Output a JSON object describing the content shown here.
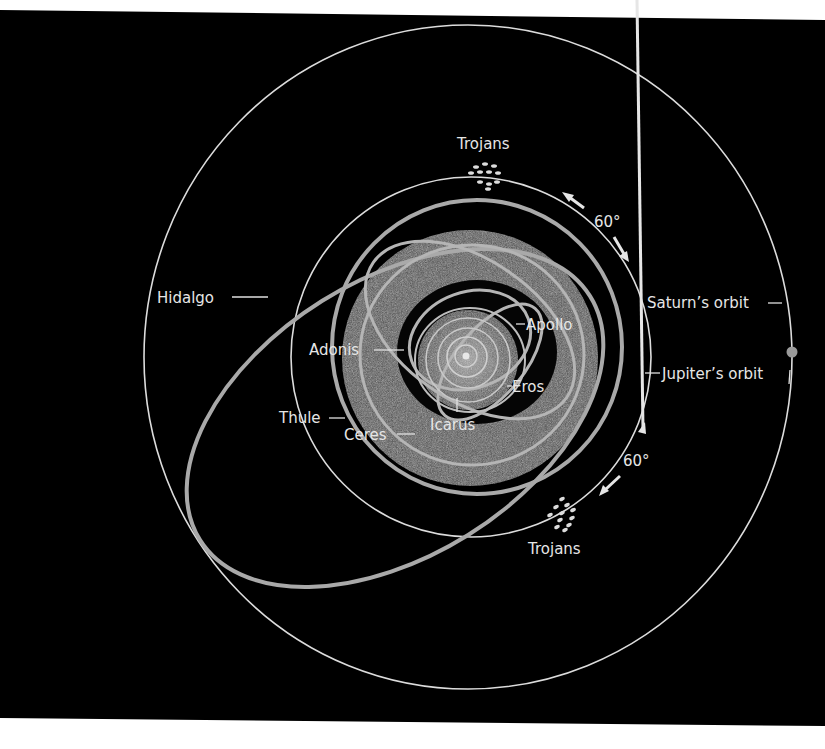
{
  "figure": {
    "colors": {
      "background": "#000000",
      "page": "#ffffff",
      "orbit_line": "#dcdcdc",
      "asteroid_orbit": "#a9a9a9",
      "belt": "#555555",
      "saturn_dot": "#9a9a9a"
    }
  },
  "labels": {
    "trojans_top": "Trojans",
    "trojans_bottom": "Trojans",
    "angle_top": "60°",
    "angle_bottom": "60°",
    "hidalgo": "Hidalgo",
    "saturn_orbit": "Saturn’s orbit",
    "jupiter_orbit": "Jupiter’s orbit",
    "apollo": "Apollo",
    "adonis": "Adonis",
    "eros": "Eros",
    "thule": "Thule",
    "ceres": "Ceres",
    "icarus": "Icarus"
  },
  "objects": [
    {
      "name": "Saturn",
      "type": "orbit"
    },
    {
      "name": "Jupiter",
      "type": "orbit"
    },
    {
      "name": "Trojans",
      "type": "asteroid-group",
      "positions": [
        "60° ahead of Jupiter",
        "60° behind Jupiter"
      ]
    },
    {
      "name": "Hidalgo",
      "type": "asteroid-orbit"
    },
    {
      "name": "Thule",
      "type": "asteroid-orbit"
    },
    {
      "name": "Ceres",
      "type": "asteroid-orbit"
    },
    {
      "name": "Adonis",
      "type": "asteroid-orbit"
    },
    {
      "name": "Apollo",
      "type": "asteroid-orbit"
    },
    {
      "name": "Eros",
      "type": "asteroid-orbit"
    },
    {
      "name": "Icarus",
      "type": "asteroid-orbit"
    }
  ]
}
